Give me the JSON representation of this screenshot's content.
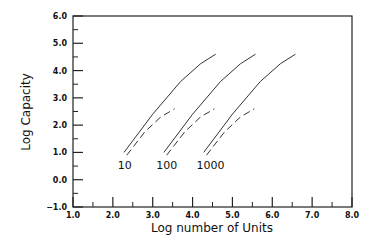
{
  "chart_data": {
    "type": "line",
    "title": "",
    "xlabel": "Log number of Units",
    "ylabel": "Log Capacity",
    "xlim": [
      1.0,
      8.0
    ],
    "ylim": [
      -1.0,
      6.0
    ],
    "xticks": [
      "1.0",
      "2.0",
      "3.0",
      "4.0",
      "5.0",
      "6.0",
      "7.0",
      "8.0"
    ],
    "yticks": [
      "-1.0",
      "0.0",
      "1.0",
      "2.0",
      "3.0",
      "4.0",
      "5.0",
      "6.0"
    ],
    "grid": false,
    "legend": "none",
    "series": [
      {
        "name": "10 (solid)",
        "style": "solid",
        "x": [
          2.28,
          3.0,
          3.7,
          4.2,
          4.58
        ],
        "y": [
          1.0,
          2.4,
          3.6,
          4.25,
          4.6
        ]
      },
      {
        "name": "10 (dashed)",
        "style": "dashed",
        "x": [
          2.35,
          2.8,
          3.2,
          3.55
        ],
        "y": [
          0.9,
          1.75,
          2.3,
          2.6
        ]
      },
      {
        "name": "100 (solid)",
        "style": "solid",
        "x": [
          3.28,
          4.0,
          4.7,
          5.2,
          5.58
        ],
        "y": [
          1.0,
          2.4,
          3.6,
          4.25,
          4.6
        ]
      },
      {
        "name": "100 (dashed)",
        "style": "dashed",
        "x": [
          3.35,
          3.8,
          4.2,
          4.55
        ],
        "y": [
          0.9,
          1.75,
          2.3,
          2.6
        ]
      },
      {
        "name": "1000 (solid)",
        "style": "solid",
        "x": [
          4.28,
          5.0,
          5.7,
          6.2,
          6.58
        ],
        "y": [
          1.0,
          2.4,
          3.6,
          4.25,
          4.6
        ]
      },
      {
        "name": "1000 (dashed)",
        "style": "dashed",
        "x": [
          4.35,
          4.8,
          5.2,
          5.55
        ],
        "y": [
          0.9,
          1.75,
          2.3,
          2.6
        ]
      }
    ],
    "annotations": [
      {
        "text": "10",
        "x": 2.3,
        "y": 0.55
      },
      {
        "text": "100",
        "x": 3.35,
        "y": 0.55
      },
      {
        "text": "1000",
        "x": 4.45,
        "y": 0.55
      }
    ]
  }
}
